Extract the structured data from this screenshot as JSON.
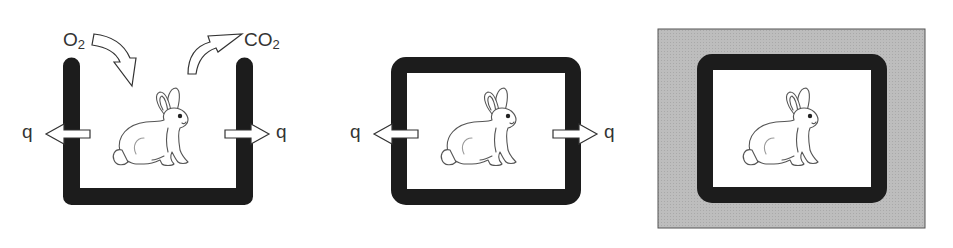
{
  "colors": {
    "wall": "#1c1c1c",
    "background": "#ffffff",
    "surroundings": "#b9b9b9",
    "outline": "#555555"
  },
  "panels": [
    {
      "id": "open-system",
      "labels": {
        "oxygen": {
          "main": "O",
          "sub": "2"
        },
        "carbon_dioxide": {
          "main": "CO",
          "sub": "2"
        },
        "heat_left": "q",
        "heat_right": "q"
      },
      "icons": [
        "rabbit-icon",
        "curved-arrow-in-icon",
        "curved-arrow-out-icon",
        "arrow-left-icon",
        "arrow-right-icon"
      ]
    },
    {
      "id": "closed-system",
      "labels": {
        "heat_left": "q",
        "heat_right": "q"
      },
      "icons": [
        "rabbit-icon",
        "arrow-left-icon",
        "arrow-right-icon"
      ]
    },
    {
      "id": "isolated-system",
      "labels": {},
      "icons": [
        "rabbit-icon"
      ]
    }
  ]
}
